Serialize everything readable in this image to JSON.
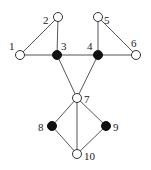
{
  "diagram": {
    "type": "graph",
    "nodes": [
      {
        "id": "1",
        "label": "1",
        "x": 20,
        "y": 55,
        "filled": false,
        "lx": 9,
        "ly": 50
      },
      {
        "id": "2",
        "label": "2",
        "x": 58,
        "y": 17,
        "filled": false,
        "lx": 43,
        "ly": 24
      },
      {
        "id": "3",
        "label": "3",
        "x": 57,
        "y": 55,
        "filled": true,
        "lx": 61,
        "ly": 50
      },
      {
        "id": "4",
        "label": "4",
        "x": 98,
        "y": 55,
        "filled": true,
        "lx": 87,
        "ly": 50
      },
      {
        "id": "5",
        "label": "5",
        "x": 98,
        "y": 17,
        "filled": false,
        "lx": 104,
        "ly": 24
      },
      {
        "id": "6",
        "label": "6",
        "x": 136,
        "y": 55,
        "filled": false,
        "lx": 131,
        "ly": 47
      },
      {
        "id": "7",
        "label": "7",
        "x": 77,
        "y": 98,
        "filled": false,
        "lx": 84,
        "ly": 103
      },
      {
        "id": "8",
        "label": "8",
        "x": 52,
        "y": 126,
        "filled": true,
        "lx": 38,
        "ly": 131
      },
      {
        "id": "9",
        "label": "9",
        "x": 106,
        "y": 126,
        "filled": true,
        "lx": 113,
        "ly": 131
      },
      {
        "id": "10",
        "label": "10",
        "x": 77,
        "y": 154,
        "filled": false,
        "lx": 84,
        "ly": 160
      }
    ],
    "edges": [
      [
        "1",
        "2"
      ],
      [
        "1",
        "3"
      ],
      [
        "2",
        "3"
      ],
      [
        "3",
        "4"
      ],
      [
        "4",
        "5"
      ],
      [
        "4",
        "6"
      ],
      [
        "5",
        "6"
      ],
      [
        "3",
        "7"
      ],
      [
        "4",
        "7"
      ],
      [
        "7",
        "8"
      ],
      [
        "7",
        "9"
      ],
      [
        "7",
        "10"
      ],
      [
        "8",
        "10"
      ],
      [
        "9",
        "10"
      ]
    ],
    "node_radius": 4.5
  }
}
